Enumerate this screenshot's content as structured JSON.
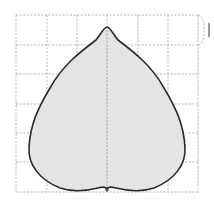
{
  "figure": {
    "grid": {
      "columns": 6,
      "rows": 6,
      "line_color": "#a8a8a8",
      "line_style": "dashed"
    },
    "leaf": {
      "fill": "#e4e4e4",
      "stroke": "#2a2a2a"
    },
    "bracket_mark": {
      "label": "I",
      "spans_rows": 1
    }
  }
}
